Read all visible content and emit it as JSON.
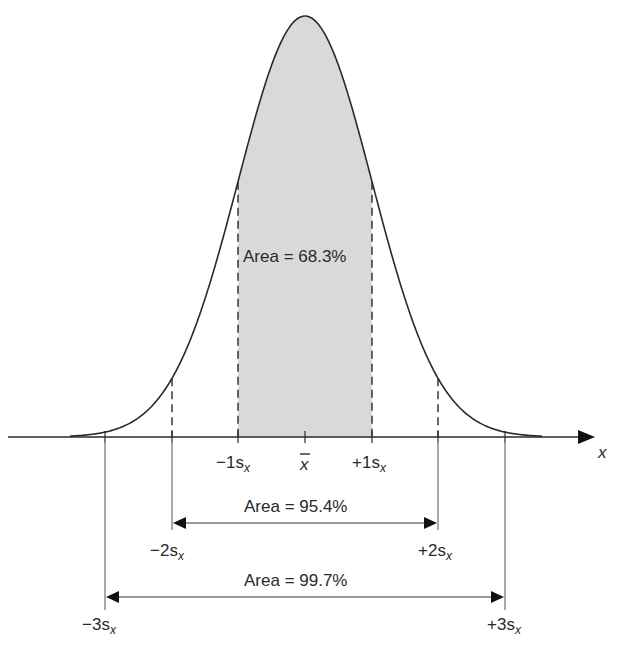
{
  "diagram": {
    "axis_label": "x",
    "mean_label": "x",
    "tick_labels": {
      "minus3": "−3s",
      "minus2": "−2s",
      "minus1": "−1s",
      "plus1": "+1s",
      "plus2": "+2s",
      "plus3": "+3s",
      "subscript": "x"
    },
    "areas": {
      "one_sigma": "Area = 68.3%",
      "two_sigma": "Area = 95.4%",
      "three_sigma": "Area = 99.7%"
    },
    "colors": {
      "shade": "#d9d9d9",
      "line": "#2a2a2a"
    }
  },
  "chart_data": {
    "type": "area",
    "title": "",
    "xlabel": "x",
    "ylabel": "",
    "categories": [
      "−3s",
      "−2s",
      "−1s",
      "x̄",
      "+1s",
      "+2s",
      "+3s"
    ],
    "intervals": [
      {
        "range": "±1s",
        "area_percent": 68.3,
        "shaded": true
      },
      {
        "range": "±2s",
        "area_percent": 95.4,
        "shaded": false
      },
      {
        "range": "±3s",
        "area_percent": 99.7,
        "shaded": false
      }
    ],
    "grid": false
  }
}
